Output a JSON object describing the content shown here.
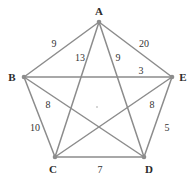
{
  "figure": {
    "title": "",
    "type": "weighted-complete-graph-K5",
    "background_color": "#ffffff",
    "edge_color": "#8c8c8c",
    "vertex_color": "#8c8c8c",
    "label_color": "#2b2b2b",
    "weight_color": "#333333"
  },
  "vertices": [
    {
      "id": "A",
      "label": "A",
      "x": 99,
      "y": 22,
      "label_x": 99,
      "label_y": 11
    },
    {
      "id": "B",
      "label": "B",
      "x": 24,
      "y": 77,
      "label_x": 12,
      "label_y": 77
    },
    {
      "id": "C",
      "label": "C",
      "x": 55,
      "y": 157,
      "label_x": 53,
      "label_y": 169
    },
    {
      "id": "D",
      "label": "D",
      "x": 144,
      "y": 157,
      "label_x": 149,
      "label_y": 169
    },
    {
      "id": "E",
      "label": "E",
      "x": 172,
      "y": 77,
      "label_x": 183,
      "label_y": 77
    }
  ],
  "edges": [
    {
      "from": "A",
      "to": "B",
      "weight": "9",
      "label_x": 54,
      "label_y": 44
    },
    {
      "from": "A",
      "to": "E",
      "weight": "20",
      "label_x": 144,
      "label_y": 44
    },
    {
      "from": "A",
      "to": "C",
      "weight": "13",
      "label_x": 80,
      "label_y": 58
    },
    {
      "from": "A",
      "to": "D",
      "weight": "9",
      "label_x": 118,
      "label_y": 58
    },
    {
      "from": "B",
      "to": "E",
      "weight": "3",
      "label_x": 141,
      "label_y": 71
    },
    {
      "from": "B",
      "to": "D",
      "weight": "8",
      "label_x": 48,
      "label_y": 105
    },
    {
      "from": "C",
      "to": "E",
      "weight": "8",
      "label_x": 152,
      "label_y": 105
    },
    {
      "from": "B",
      "to": "C",
      "weight": "10",
      "label_x": 35,
      "label_y": 128
    },
    {
      "from": "D",
      "to": "E",
      "weight": "5",
      "label_x": 167,
      "label_y": 128
    },
    {
      "from": "C",
      "to": "D",
      "weight": "7",
      "label_x": 100,
      "label_y": 170
    }
  ],
  "chart_data": {
    "type": "diagram",
    "title": "",
    "graph_type": "complete graph K5 with edge weights",
    "nodes": [
      "A",
      "B",
      "C",
      "D",
      "E"
    ],
    "weighted_edges": [
      [
        "A",
        "B",
        9
      ],
      [
        "A",
        "C",
        13
      ],
      [
        "A",
        "D",
        9
      ],
      [
        "A",
        "E",
        20
      ],
      [
        "B",
        "C",
        10
      ],
      [
        "B",
        "D",
        8
      ],
      [
        "B",
        "E",
        3
      ],
      [
        "C",
        "D",
        7
      ],
      [
        "C",
        "E",
        8
      ],
      [
        "D",
        "E",
        5
      ]
    ]
  },
  "artifact": {
    "x": 97,
    "y": 107
  }
}
